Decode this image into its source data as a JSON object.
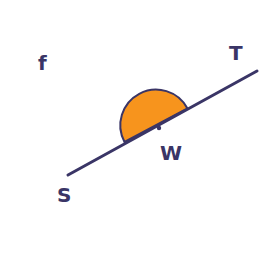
{
  "diagram": {
    "labels": {
      "plane": "f",
      "point_t": "T",
      "point_w": "W",
      "point_s": "S"
    },
    "colors": {
      "line": "#3a3566",
      "semicircle_fill": "#f7941d",
      "background": "#ffffff"
    },
    "elements": {
      "line": "line ST",
      "semicircle": "half-disc on line ST centered at W",
      "center_point": "W"
    }
  }
}
